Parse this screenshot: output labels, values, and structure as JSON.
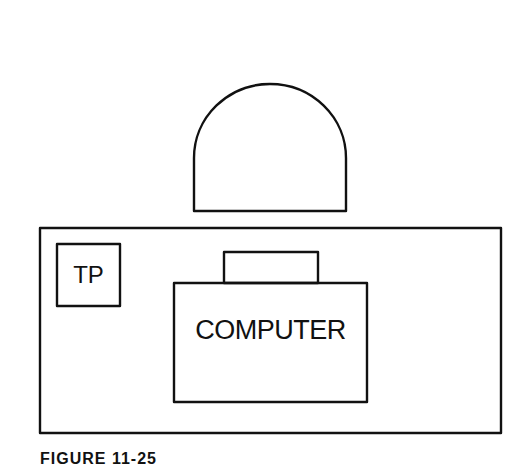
{
  "figure": {
    "caption": "FIGURE 11-25",
    "stroke_color": "#111111",
    "background_color": "#ffffff"
  },
  "diagram": {
    "nodes": [
      {
        "id": "dome",
        "shape": "dome",
        "label": ""
      },
      {
        "id": "enclosure",
        "shape": "rectangle",
        "label": ""
      },
      {
        "id": "tp",
        "shape": "square",
        "label": "TP"
      },
      {
        "id": "computer",
        "shape": "rectangle",
        "label": "COMPUTER"
      },
      {
        "id": "computer-tab",
        "shape": "rectangle",
        "label": ""
      }
    ]
  },
  "labels": {
    "tp": "TP",
    "computer": "COMPUTER"
  }
}
